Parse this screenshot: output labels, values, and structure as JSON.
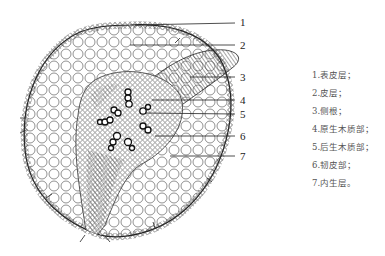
{
  "diagram": {
    "type": "root-cross-section-lateral-root",
    "labels": [
      {
        "num": "1",
        "x": 240,
        "y": 17
      },
      {
        "num": "2",
        "x": 240,
        "y": 40
      },
      {
        "num": "3",
        "x": 240,
        "y": 72
      },
      {
        "num": "4",
        "x": 240,
        "y": 96
      },
      {
        "num": "5",
        "x": 240,
        "y": 110
      },
      {
        "num": "6",
        "x": 240,
        "y": 132
      },
      {
        "num": "7",
        "x": 240,
        "y": 154
      }
    ]
  },
  "legend": {
    "items": [
      "1.表皮层；",
      "2.皮层；",
      "3.侧根；",
      "4.原生木质部；",
      "5.后生木质部；",
      "6.韧皮部；",
      "7.内生层。"
    ]
  },
  "colors": {
    "line": "#222222",
    "text": "#555555",
    "background": "#ffffff"
  }
}
